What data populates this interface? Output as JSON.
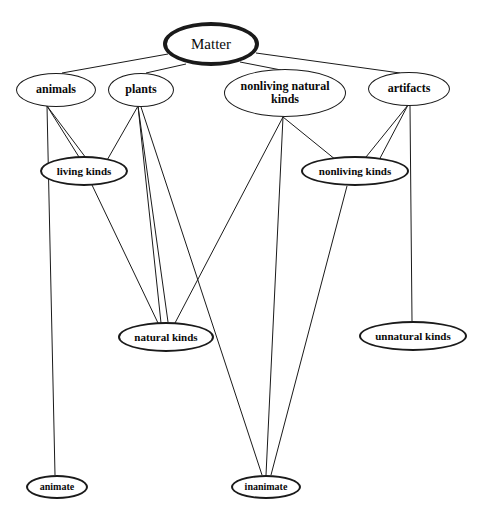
{
  "diagram": {
    "background_color": "#ffffff",
    "line_color": "#1a1a1a",
    "text_color": "#0a0a0a",
    "nodes": [
      {
        "id": "matter",
        "label": "Matter",
        "x": 211,
        "y": 44,
        "rx": 48,
        "ry": 22,
        "weight": "plain",
        "border": "thick",
        "font_size": 15,
        "level": 0
      },
      {
        "id": "animals",
        "label": "animals",
        "x": 56,
        "y": 90,
        "rx": 40,
        "ry": 17,
        "weight": "bold",
        "border": "thin",
        "font_size": 12,
        "level": 1
      },
      {
        "id": "plants",
        "label": "plants",
        "x": 141,
        "y": 90,
        "rx": 33,
        "ry": 17,
        "weight": "bold",
        "border": "thin",
        "font_size": 12,
        "level": 1
      },
      {
        "id": "nonliving-natural-kinds",
        "label": "nonliving natural kinds",
        "x": 285,
        "y": 93,
        "rx": 61,
        "ry": 24,
        "weight": "bold",
        "border": "thin",
        "font_size": 12,
        "level": 1
      },
      {
        "id": "artifacts",
        "label": "artifacts",
        "x": 409,
        "y": 89,
        "rx": 41,
        "ry": 17,
        "weight": "bold",
        "border": "thin",
        "font_size": 12,
        "level": 1
      },
      {
        "id": "living-kinds",
        "label": "living kinds",
        "x": 84,
        "y": 171,
        "rx": 44,
        "ry": 15,
        "weight": "bold",
        "border": "med",
        "font_size": 11,
        "level": 2
      },
      {
        "id": "nonliving-kinds",
        "label": "nonliving kinds",
        "x": 355,
        "y": 171,
        "rx": 54,
        "ry": 15,
        "weight": "bold",
        "border": "med",
        "font_size": 11,
        "level": 2
      },
      {
        "id": "natural-kinds",
        "label": "natural kinds",
        "x": 166,
        "y": 337,
        "rx": 48,
        "ry": 15,
        "weight": "bold",
        "border": "med",
        "font_size": 11,
        "level": 3
      },
      {
        "id": "unnatural-kinds",
        "label": "unnatural kinds",
        "x": 413,
        "y": 336,
        "rx": 54,
        "ry": 15,
        "weight": "bold",
        "border": "med",
        "font_size": 11,
        "level": 3
      },
      {
        "id": "animate",
        "label": "animate",
        "x": 57,
        "y": 487,
        "rx": 31,
        "ry": 12,
        "weight": "bold",
        "border": "med",
        "font_size": 10,
        "level": 4
      },
      {
        "id": "inanimate",
        "label": "inanimate",
        "x": 266,
        "y": 487,
        "rx": 35,
        "ry": 12,
        "weight": "bold",
        "border": "med",
        "font_size": 10,
        "level": 4
      }
    ],
    "edges": [
      {
        "from": "matter",
        "to": "animals",
        "x1": 168,
        "y1": 54,
        "x2": 62,
        "y2": 73
      },
      {
        "from": "matter",
        "to": "plants",
        "x1": 186,
        "y1": 64,
        "x2": 146,
        "y2": 73
      },
      {
        "from": "matter",
        "to": "nonliving-natural-kinds",
        "x1": 240,
        "y1": 62,
        "x2": 281,
        "y2": 70
      },
      {
        "from": "matter",
        "to": "artifacts",
        "x1": 256,
        "y1": 53,
        "x2": 400,
        "y2": 73
      },
      {
        "from": "animals",
        "to": "living-kinds",
        "x1": 47,
        "y1": 106,
        "x2": 79,
        "y2": 157
      },
      {
        "from": "animals",
        "to": "living-kinds",
        "x1": 47,
        "y1": 106,
        "x2": 86,
        "y2": 158
      },
      {
        "from": "animals",
        "to": "animate",
        "x1": 47,
        "y1": 106,
        "x2": 55,
        "y2": 475
      },
      {
        "from": "plants",
        "to": "living-kinds",
        "x1": 138,
        "y1": 106,
        "x2": 106,
        "y2": 162
      },
      {
        "from": "plants",
        "to": "natural-kinds",
        "x1": 138,
        "y1": 106,
        "x2": 161,
        "y2": 323
      },
      {
        "from": "plants",
        "to": "natural-kinds",
        "x1": 138,
        "y1": 106,
        "x2": 168,
        "y2": 322
      },
      {
        "from": "plants",
        "to": "inanimate",
        "x1": 141,
        "y1": 107,
        "x2": 262,
        "y2": 475
      },
      {
        "from": "nonliving-natural-kinds",
        "to": "natural-kinds",
        "x1": 283,
        "y1": 117,
        "x2": 175,
        "y2": 323
      },
      {
        "from": "nonliving-natural-kinds",
        "to": "inanimate",
        "x1": 283,
        "y1": 117,
        "x2": 266,
        "y2": 475
      },
      {
        "from": "nonliving-natural-kinds",
        "to": "nonliving-kinds",
        "x1": 283,
        "y1": 117,
        "x2": 336,
        "y2": 160
      },
      {
        "from": "artifacts",
        "to": "nonliving-kinds",
        "x1": 408,
        "y1": 105,
        "x2": 366,
        "y2": 157
      },
      {
        "from": "artifacts",
        "to": "nonliving-kinds",
        "x1": 408,
        "y1": 105,
        "x2": 378,
        "y2": 162
      },
      {
        "from": "artifacts",
        "to": "unnatural-kinds",
        "x1": 410,
        "y1": 106,
        "x2": 412,
        "y2": 321
      },
      {
        "from": "living-kinds",
        "to": "natural-kinds",
        "x1": 92,
        "y1": 185,
        "x2": 158,
        "y2": 323
      },
      {
        "from": "nonliving-kinds",
        "to": "inanimate",
        "x1": 347,
        "y1": 186,
        "x2": 271,
        "y2": 475
      }
    ]
  }
}
